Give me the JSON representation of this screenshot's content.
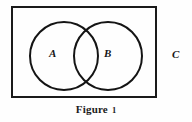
{
  "figure": {
    "type": "venn-diagram",
    "universe_label": "C",
    "sets": [
      {
        "id": "A",
        "label": "A"
      },
      {
        "id": "B",
        "label": "B"
      }
    ],
    "caption": {
      "word": "Figure",
      "number": "1",
      "full_text": "Figure 1"
    },
    "colors": {
      "stroke": "#141414",
      "rect_stroke": "#1a1a1a",
      "text": "#161616",
      "background": "#fefefe"
    }
  }
}
